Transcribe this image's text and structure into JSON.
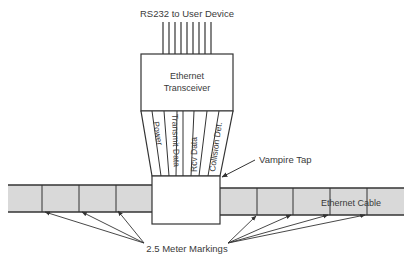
{
  "diagram": {
    "title_top": "RS232 to User Device",
    "transceiver": {
      "line1": "Ethernet",
      "line2": "Transceiver"
    },
    "signals": [
      {
        "label": "Power"
      },
      {
        "label": "Transmit Data"
      },
      {
        "label": "Rcv Data"
      },
      {
        "label": "Collision Det."
      }
    ],
    "tap_label": "Vampire Tap",
    "cable_label": "Ethernet Cable",
    "markings_label": "2.5 Meter Markings",
    "colors": {
      "cable_fill": "#d9d9d9",
      "line": "#333333",
      "text": "#3a3a3a"
    }
  }
}
